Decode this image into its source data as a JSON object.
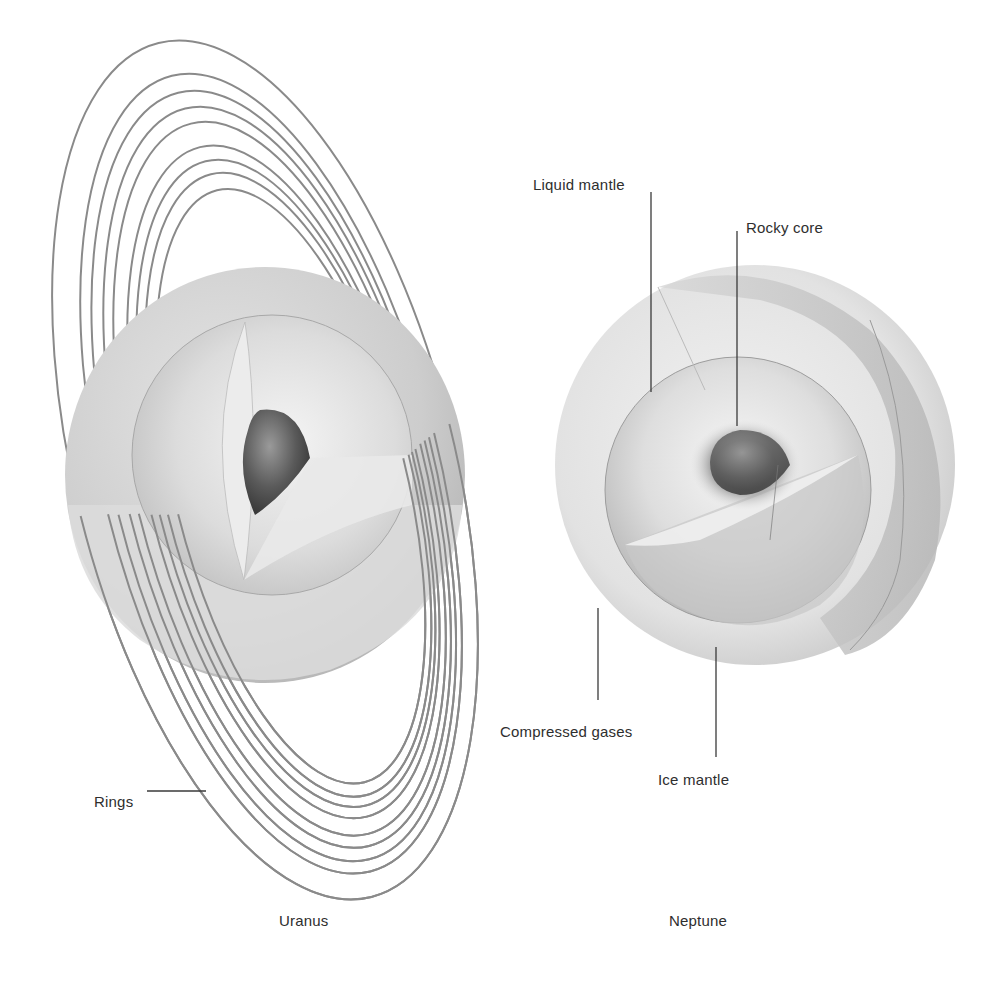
{
  "figure": {
    "planets": [
      {
        "name": "Uranus",
        "labels": {
          "rings": "Rings"
        }
      },
      {
        "name": "Neptune",
        "labels": {
          "liquid_mantle": "Liquid mantle",
          "rocky_core": "Rocky core",
          "compressed_gases": "Compressed gases",
          "ice_mantle": "Ice mantle"
        }
      }
    ]
  },
  "colors": {
    "background": "#ffffff",
    "ring": "#8a8a8a",
    "leader_line": "#3a3a3a",
    "core": "#555555",
    "shell_light": "#e6e6e6",
    "shell_mid": "#cfcfcf"
  }
}
